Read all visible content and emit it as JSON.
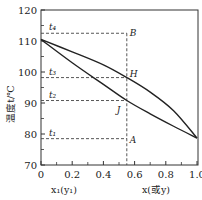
{
  "chart_data": {
    "type": "line",
    "title": "",
    "xlabel_left": "x₁(y₁)",
    "xlabel_right": "x(或y)",
    "ylabel": "温度t/℃",
    "xlim": [
      0,
      1.0
    ],
    "ylim": [
      70,
      120
    ],
    "x_ticks": [
      0,
      0.2,
      0.4,
      0.6,
      0.8,
      1.0
    ],
    "x_tick_labels": [
      "0",
      "0.2",
      "0.4",
      "0.6",
      "0.8",
      "1.0"
    ],
    "x_minor_step": 0.1,
    "y_ticks": [
      70,
      80,
      90,
      100,
      110,
      120
    ],
    "y_tick_labels": [
      "70",
      "80",
      "90",
      "100",
      "110",
      "120"
    ],
    "y_minor_step": 5,
    "grid": false,
    "series": [
      {
        "name": "dew-point curve (upper)",
        "points": [
          [
            0,
            110.5
          ],
          [
            0.2,
            106.5
          ],
          [
            0.4,
            102.3
          ],
          [
            0.55,
            98.2
          ],
          [
            0.7,
            93.5
          ],
          [
            0.85,
            87.5
          ],
          [
            1.0,
            78.7
          ]
        ]
      },
      {
        "name": "bubble-point curve (lower)",
        "points": [
          [
            0,
            110.5
          ],
          [
            0.2,
            103.0
          ],
          [
            0.4,
            96.0
          ],
          [
            0.55,
            90.8
          ],
          [
            0.7,
            86.5
          ],
          [
            0.85,
            82.5
          ],
          [
            1.0,
            78.7
          ]
        ]
      }
    ],
    "composition_line": {
      "x": 0.55,
      "label_top": "B",
      "label_bottom": "A"
    },
    "isotherms": [
      {
        "label": "t₄",
        "y": 112.5,
        "point": "B"
      },
      {
        "label": "t₃",
        "y": 98.2,
        "point": "H"
      },
      {
        "label": "t₂",
        "y": 90.8,
        "point": "J"
      },
      {
        "label": "t₁",
        "y": 78.5,
        "point": "A"
      }
    ],
    "points": [
      {
        "name": "B",
        "x": 0.55,
        "y": 112.5
      },
      {
        "name": "H",
        "x": 0.55,
        "y": 98.2
      },
      {
        "name": "J",
        "x": 0.55,
        "y": 90.8
      },
      {
        "name": "A",
        "x": 0.55,
        "y": 78.5
      }
    ]
  }
}
